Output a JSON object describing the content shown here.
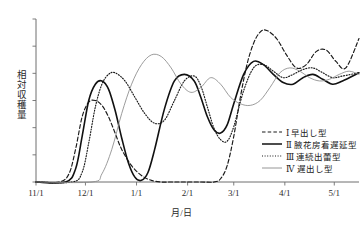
{
  "chart_data": {
    "type": "line",
    "title": "",
    "xlabel": "月/日",
    "ylabel": "相対収穫量",
    "grid": false,
    "legend_position": "inside-bottom-right",
    "x_tick_labels": [
      "11/1",
      "12/1",
      "1/1",
      "2/1",
      "3/1",
      "4/1",
      "5/1"
    ],
    "x_tick_days": [
      0,
      30,
      61,
      92,
      120,
      151,
      181
    ],
    "xlim_days": [
      0,
      196
    ],
    "ylim": [
      0,
      1.0
    ],
    "y_tick_count": 6,
    "y_axis_labeled": false,
    "series": [
      {
        "name": "Ⅰ 早出し型",
        "numeral": "Ⅰ",
        "label": "早出し型",
        "style": "dashed",
        "color": "#1a1a1a",
        "x": [
          0,
          14,
          20,
          24,
          28,
          32,
          36,
          40,
          44,
          48,
          52,
          58,
          64,
          70,
          76,
          82,
          90,
          100,
          108,
          112,
          116,
          120,
          124,
          128,
          132,
          136,
          140,
          146,
          152,
          158,
          164,
          170,
          176,
          182,
          188,
          196
        ],
        "y": [
          0.0,
          0.0,
          0.05,
          0.2,
          0.4,
          0.49,
          0.5,
          0.47,
          0.4,
          0.3,
          0.2,
          0.1,
          0.04,
          0.01,
          0.0,
          0.0,
          0.0,
          0.0,
          0.0,
          0.02,
          0.1,
          0.28,
          0.52,
          0.72,
          0.85,
          0.92,
          0.93,
          0.88,
          0.78,
          0.7,
          0.72,
          0.8,
          0.81,
          0.74,
          0.7,
          0.88
        ]
      },
      {
        "name": "Ⅱ 腋花房着遅延型",
        "numeral": "Ⅱ",
        "label": "腋花房着遅延型",
        "style": "solid",
        "color": "#111111",
        "x": [
          0,
          18,
          24,
          28,
          32,
          36,
          40,
          44,
          48,
          52,
          56,
          60,
          64,
          68,
          72,
          78,
          84,
          90,
          96,
          100,
          104,
          108,
          112,
          116,
          120,
          126,
          132,
          138,
          144,
          150,
          156,
          162,
          168,
          174,
          180,
          186,
          196
        ],
        "y": [
          0.0,
          0.0,
          0.08,
          0.28,
          0.5,
          0.6,
          0.62,
          0.57,
          0.44,
          0.27,
          0.12,
          0.03,
          0.01,
          0.06,
          0.2,
          0.45,
          0.62,
          0.66,
          0.62,
          0.52,
          0.4,
          0.32,
          0.3,
          0.35,
          0.48,
          0.66,
          0.74,
          0.72,
          0.66,
          0.61,
          0.6,
          0.64,
          0.66,
          0.63,
          0.6,
          0.62,
          0.67
        ]
      },
      {
        "name": "Ⅲ 連続出蕾型",
        "numeral": "Ⅲ",
        "label": "連続出蕾型",
        "style": "dotted",
        "color": "#1a1a1a",
        "x": [
          0,
          22,
          28,
          32,
          36,
          40,
          44,
          48,
          54,
          60,
          66,
          72,
          78,
          84,
          90,
          96,
          100,
          104,
          108,
          112,
          116,
          120,
          126,
          132,
          138,
          144,
          150,
          156,
          162,
          168,
          174,
          180,
          186,
          196
        ],
        "y": [
          0.0,
          0.0,
          0.06,
          0.24,
          0.46,
          0.6,
          0.66,
          0.67,
          0.62,
          0.52,
          0.42,
          0.36,
          0.38,
          0.5,
          0.62,
          0.65,
          0.59,
          0.46,
          0.33,
          0.26,
          0.25,
          0.34,
          0.56,
          0.7,
          0.72,
          0.68,
          0.64,
          0.66,
          0.69,
          0.7,
          0.67,
          0.64,
          0.65,
          0.67
        ]
      },
      {
        "name": "Ⅳ 遅出し型",
        "numeral": "Ⅳ",
        "label": "遅出し型",
        "style": "thin-solid",
        "color": "#8a8a8a",
        "x": [
          0,
          34,
          40,
          46,
          52,
          58,
          64,
          70,
          76,
          82,
          88,
          94,
          100,
          106,
          112,
          118,
          124,
          130,
          136,
          142,
          148,
          154,
          160,
          166,
          172,
          178,
          184,
          190,
          196
        ],
        "y": [
          0.0,
          0.0,
          0.05,
          0.2,
          0.42,
          0.6,
          0.72,
          0.78,
          0.77,
          0.7,
          0.6,
          0.55,
          0.58,
          0.64,
          0.6,
          0.52,
          0.48,
          0.47,
          0.5,
          0.58,
          0.67,
          0.7,
          0.68,
          0.64,
          0.62,
          0.63,
          0.66,
          0.68,
          0.66
        ]
      }
    ]
  },
  "legend": {
    "items": [
      {
        "label": "Ⅰ 早出し型"
      },
      {
        "label": "Ⅱ 腋花房着遅延型"
      },
      {
        "label": "Ⅲ 連続出蕾型"
      },
      {
        "label": "Ⅳ 遅出し型"
      }
    ]
  },
  "axes": {
    "x_title": "月/日",
    "y_title": "相対収穫量"
  }
}
